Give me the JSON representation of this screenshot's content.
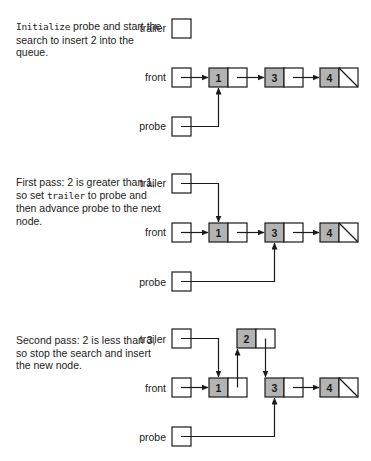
{
  "panels": [
    {
      "caption_pre": "",
      "caption_code": "Initialize",
      "caption_post": " probe and start the search to insert 2 into the queue.",
      "labels": {
        "trailer": "trailer",
        "front": "front",
        "probe": "probe"
      },
      "nodes": [
        {
          "value": "1"
        },
        {
          "value": "3"
        },
        {
          "value": "4"
        }
      ]
    },
    {
      "caption_pre": "First pass: 2 is greater than 1, so set ",
      "caption_code": "trailer",
      "caption_post": " to probe and then advance probe to the next node.",
      "labels": {
        "trailer": "trailer",
        "front": "front",
        "probe": "probe"
      },
      "nodes": [
        {
          "value": "1"
        },
        {
          "value": "3"
        },
        {
          "value": "4"
        }
      ]
    },
    {
      "caption_pre": "Second pass: 2 is less than 3, so stop the search and insert the new node.",
      "caption_code": "",
      "caption_post": "",
      "labels": {
        "trailer": "trailer",
        "front": "front",
        "probe": "probe"
      },
      "nodes": [
        {
          "value": "1"
        },
        {
          "value": "2"
        },
        {
          "value": "3"
        },
        {
          "value": "4"
        }
      ]
    }
  ],
  "colors": {
    "node_fill": "#b3b3b3",
    "line": "#1a1a1a"
  }
}
